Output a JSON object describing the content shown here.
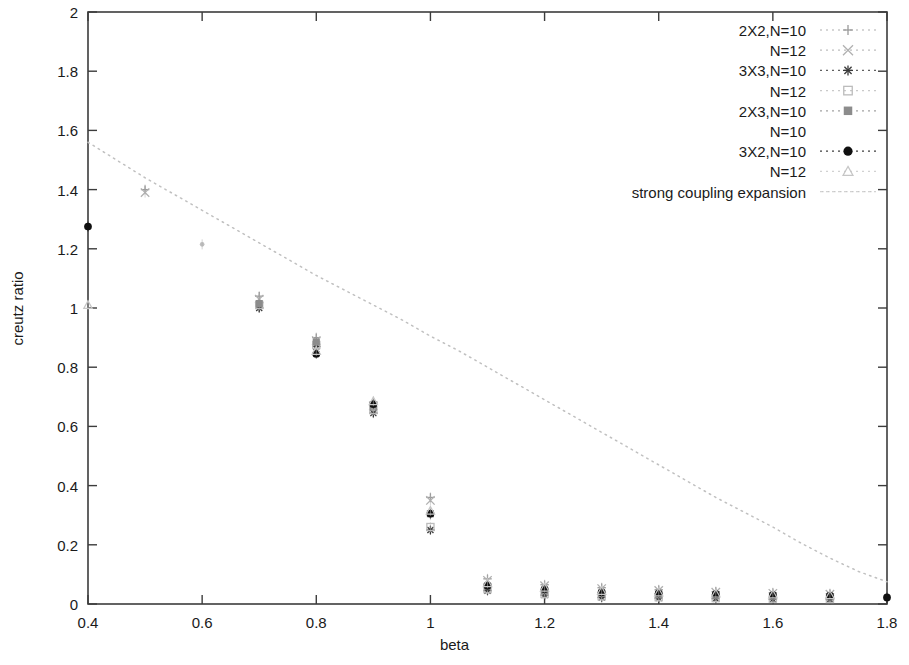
{
  "chart_data": {
    "type": "scatter",
    "title": "",
    "xlabel": "beta",
    "ylabel": "creutz ratio",
    "xlim": [
      0.4,
      1.8
    ],
    "ylim": [
      0,
      2
    ],
    "grid": false,
    "legend_position": "top-right",
    "xticks": [
      "0.4",
      "0.6",
      "0.8",
      "1",
      "1.2",
      "1.4",
      "1.6",
      "1.8"
    ],
    "xtick_values": [
      0.4,
      0.6,
      0.8,
      1.0,
      1.2,
      1.4,
      1.6,
      1.8
    ],
    "yticks": [
      "0",
      "0.2",
      "0.4",
      "0.6",
      "0.8",
      "1",
      "1.2",
      "1.4",
      "1.6",
      "1.8",
      "2"
    ],
    "ytick_values": [
      0,
      0.2,
      0.4,
      0.6,
      0.8,
      1.0,
      1.2,
      1.4,
      1.6,
      1.8,
      2.0
    ],
    "series": [
      {
        "name": "2X2,N=10",
        "marker": "plus",
        "color": "#9a9a9a",
        "x": [
          0.5,
          0.7,
          0.8,
          0.9,
          1.0,
          1.1,
          1.2,
          1.3,
          1.4,
          1.5,
          1.6,
          1.7
        ],
        "y": [
          1.4,
          1.04,
          0.9,
          0.68,
          0.36,
          0.085,
          0.065,
          0.055,
          0.048,
          0.042,
          0.038,
          0.035
        ]
      },
      {
        "name": "N=12",
        "marker": "cross",
        "color": "#b0b0b0",
        "x": [
          0.5,
          0.7,
          0.8,
          0.9,
          1.0,
          1.1,
          1.2,
          1.3,
          1.4,
          1.5,
          1.6,
          1.7
        ],
        "y": [
          1.39,
          1.03,
          0.89,
          0.67,
          0.35,
          0.08,
          0.062,
          0.052,
          0.046,
          0.04,
          0.036,
          0.033
        ]
      },
      {
        "name": "3X3,N=10",
        "marker": "star",
        "color": "#3a3a3a",
        "x": [
          0.7,
          0.8,
          0.9,
          1.0,
          1.1,
          1.2,
          1.3,
          1.4,
          1.5,
          1.6,
          1.7
        ],
        "y": [
          1.0,
          0.87,
          0.645,
          0.25,
          0.045,
          0.03,
          0.022,
          0.02,
          0.018,
          0.016,
          0.015
        ]
      },
      {
        "name": "N=12",
        "marker": "open-square",
        "color": "#bcbcbc",
        "x": [
          0.7,
          0.8,
          0.9,
          1.0,
          1.1,
          1.2,
          1.3,
          1.4,
          1.5,
          1.6,
          1.7
        ],
        "y": [
          1.01,
          0.875,
          0.655,
          0.26,
          0.05,
          0.034,
          0.026,
          0.023,
          0.02,
          0.018,
          0.017
        ]
      },
      {
        "name": "2X3,N=10",
        "marker": "filled-square",
        "color": "#8c8c8c",
        "x": [
          0.7,
          0.8,
          0.9,
          1.0,
          1.1,
          1.2,
          1.3,
          1.4,
          1.5,
          1.6,
          1.7
        ],
        "y": [
          1.015,
          0.885,
          0.665,
          0.305,
          0.06,
          0.045,
          0.036,
          0.032,
          0.029,
          0.026,
          0.024
        ]
      },
      {
        "name": "N=10",
        "marker": "none",
        "color": "#a8a8a8",
        "x": [
          0.6,
          0.8,
          0.9,
          1.0,
          1.1,
          1.2,
          1.3,
          1.4,
          1.5,
          1.6,
          1.7
        ],
        "y": [
          1.215,
          0.86,
          0.66,
          0.3,
          0.058,
          0.043,
          0.034,
          0.03,
          0.027,
          0.025,
          0.023
        ]
      },
      {
        "name": "3X2,N=10",
        "marker": "filled-circle",
        "color": "#101010",
        "x": [
          0.4,
          0.8,
          0.9,
          1.0,
          1.1,
          1.2,
          1.3,
          1.4,
          1.5,
          1.6,
          1.7,
          1.8
        ],
        "y": [
          1.275,
          0.845,
          0.675,
          0.305,
          0.062,
          0.05,
          0.04,
          0.036,
          0.033,
          0.03,
          0.028,
          0.022
        ]
      },
      {
        "name": "N=12",
        "marker": "faint-triangle",
        "color": "#c6c6c6",
        "x": [
          0.4,
          0.8,
          0.9,
          1.0,
          1.1,
          1.2,
          1.3,
          1.4,
          1.5,
          1.6,
          1.7
        ],
        "y": [
          1.01,
          0.855,
          0.685,
          0.315,
          0.07,
          0.055,
          0.044,
          0.039,
          0.035,
          0.032,
          0.03
        ]
      }
    ],
    "curve": {
      "name": "strong coupling expansion",
      "style": "dotted",
      "color": "#c0c0c0",
      "x": [
        0.4,
        0.45,
        0.5,
        0.55,
        0.6,
        0.65,
        0.7,
        0.75,
        0.8,
        0.85,
        0.9,
        0.95,
        1.0,
        1.05,
        1.1,
        1.15,
        1.2,
        1.25,
        1.3,
        1.35,
        1.4,
        1.45,
        1.5,
        1.55,
        1.6,
        1.65,
        1.7,
        1.75,
        1.8
      ],
      "y": [
        1.56,
        1.5,
        1.44,
        1.385,
        1.33,
        1.275,
        1.22,
        1.165,
        1.11,
        1.06,
        1.01,
        0.96,
        0.905,
        0.855,
        0.8,
        0.745,
        0.69,
        0.635,
        0.58,
        0.525,
        0.47,
        0.415,
        0.36,
        0.31,
        0.26,
        0.205,
        0.155,
        0.11,
        0.075
      ]
    },
    "legend_entries": [
      {
        "label": "2X2,N=10",
        "marker": "plus",
        "color": "#9a9a9a"
      },
      {
        "label": "N=12",
        "marker": "cross",
        "color": "#b0b0b0"
      },
      {
        "label": "3X3,N=10",
        "marker": "star",
        "color": "#3a3a3a"
      },
      {
        "label": "N=12",
        "marker": "open-square",
        "color": "#bcbcbc"
      },
      {
        "label": "2X3,N=10",
        "marker": "filled-square",
        "color": "#8c8c8c"
      },
      {
        "label": "N=10",
        "marker": "none",
        "color": "#a8a8a8"
      },
      {
        "label": "3X2,N=10",
        "marker": "filled-circle",
        "color": "#101010"
      },
      {
        "label": "N=12",
        "marker": "faint-triangle",
        "color": "#c6c6c6"
      },
      {
        "label": "strong coupling expansion",
        "marker": "dotted-line",
        "color": "#c8c8c8"
      }
    ]
  }
}
